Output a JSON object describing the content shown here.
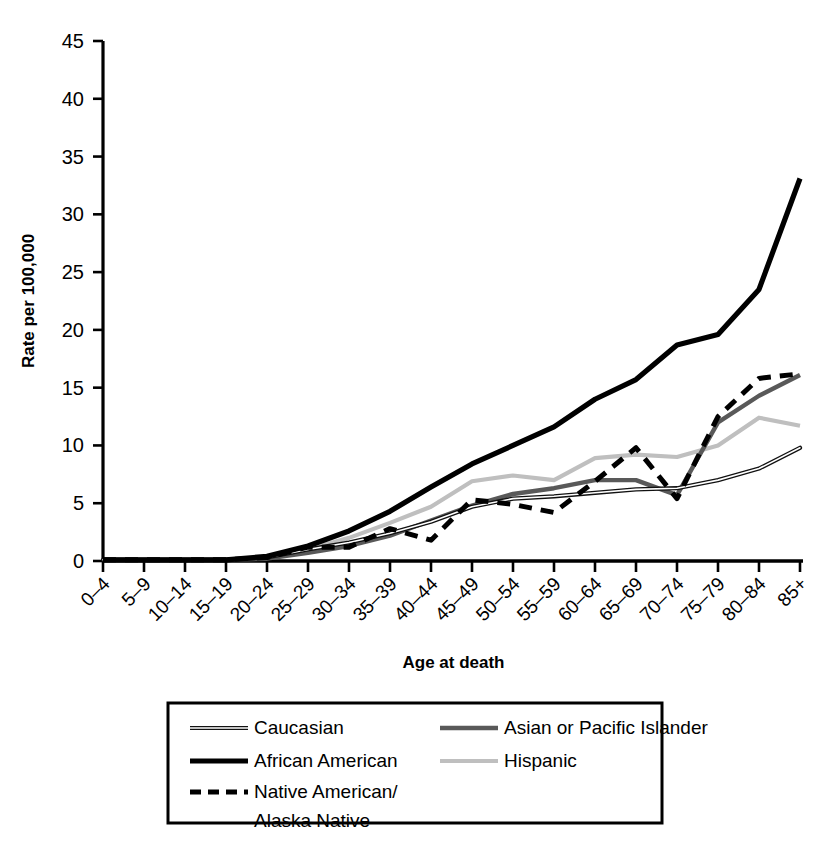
{
  "chart_data": {
    "type": "line",
    "title": "",
    "xlabel": "Age at death",
    "ylabel": "Rate per 100,000",
    "ylim": [
      0,
      45
    ],
    "yticks": [
      0,
      5,
      10,
      15,
      20,
      25,
      30,
      35,
      40,
      45
    ],
    "grid": false,
    "legend_position": "below",
    "categories": [
      "0–4",
      "5–9",
      "10–14",
      "15–19",
      "20–24",
      "25–29",
      "30–34",
      "35–39",
      "40–44",
      "45–49",
      "50–54",
      "55–59",
      "60–64",
      "65–69",
      "70–74",
      "75–79",
      "80–84",
      "85+"
    ],
    "series": [
      {
        "name": "Caucasian",
        "style": "thin-solid-dark",
        "color": "#1a1a1a",
        "values": [
          0.1,
          0.1,
          0.1,
          0.1,
          0.3,
          1.0,
          1.6,
          2.4,
          3.4,
          4.7,
          5.4,
          5.6,
          5.9,
          6.2,
          6.3,
          7.0,
          8.0,
          9.8
        ]
      },
      {
        "name": "African American",
        "style": "thick-solid-black",
        "color": "#000000",
        "values": [
          0.1,
          0.1,
          0.1,
          0.1,
          0.4,
          1.3,
          2.6,
          4.3,
          6.4,
          8.4,
          10.0,
          11.6,
          14.0,
          15.7,
          18.7,
          19.6,
          23.5,
          33.1
        ]
      },
      {
        "name": "Native American/Alaska Native",
        "style": "dashed-black",
        "color": "#000000",
        "values": [
          0.1,
          0.1,
          0.1,
          0.1,
          0.3,
          1.2,
          1.2,
          2.8,
          1.8,
          5.3,
          4.9,
          4.2,
          6.9,
          9.8,
          5.4,
          12.5,
          15.8,
          16.2
        ]
      },
      {
        "name": "Asian or Pacific Islander",
        "style": "medium-solid-gray",
        "color": "#595959",
        "values": [
          0.1,
          0.1,
          0.1,
          0.1,
          0.2,
          0.7,
          1.3,
          2.2,
          3.5,
          4.8,
          5.8,
          6.3,
          7.0,
          7.0,
          5.7,
          12.0,
          14.3,
          16.1
        ]
      },
      {
        "name": "Hispanic",
        "style": "light-solid-gray",
        "color": "#bfbfbf",
        "values": [
          0.1,
          0.1,
          0.1,
          0.1,
          0.3,
          1.0,
          2.0,
          3.3,
          4.7,
          6.9,
          7.4,
          7.0,
          8.9,
          9.2,
          9.0,
          10.0,
          12.4,
          11.7
        ]
      }
    ]
  },
  "legend": {
    "entries": [
      {
        "label": "Caucasian",
        "swatch": "thin-solid-dark"
      },
      {
        "label": "Asian or Pacific Islander",
        "swatch": "medium-solid-gray"
      },
      {
        "label": "African American",
        "swatch": "thick-solid-black"
      },
      {
        "label": "Hispanic",
        "swatch": "light-solid-gray"
      },
      {
        "label": "Native American/",
        "label2": "Alaska Native",
        "swatch": "dashed-black"
      }
    ]
  }
}
